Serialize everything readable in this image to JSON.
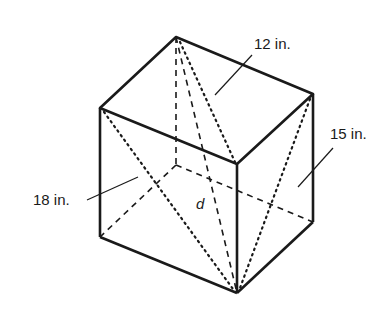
{
  "diagram": {
    "type": "rectangular prism with diagonals",
    "labels": {
      "top_edge": "12 in.",
      "right_edge": "15 in.",
      "left_edge": "18 in.",
      "diagonal": "d"
    },
    "colors": {
      "stroke": "#1a1a1a",
      "background": "#ffffff"
    }
  }
}
